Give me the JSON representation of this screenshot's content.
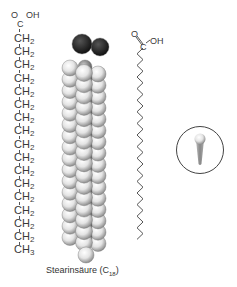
{
  "formula": {
    "carboxyl_O": "O",
    "carboxyl_OH": "OH",
    "carboxyl_C": "C",
    "repeat_unit": "CH",
    "repeat_sub": "2",
    "repeat_count": 16,
    "terminal": "CH",
    "terminal_sub": "3"
  },
  "skeletal": {
    "O": "O",
    "C": "C",
    "OH": "OH"
  },
  "caption": {
    "name": "Stearinsäure (C",
    "sub": "18",
    "close": ")"
  },
  "colors": {
    "oxygen": "#1a1a1a",
    "carbon": "#8a8a8a",
    "hydrogen": "#f0f0f0",
    "line": "#555555"
  }
}
